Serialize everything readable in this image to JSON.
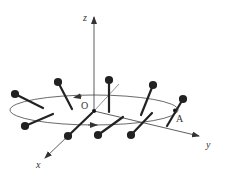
{
  "diagram": {
    "labels": {
      "z_axis": "z",
      "y_axis": "y",
      "x_axis": "x",
      "origin": "O",
      "point_a": "A"
    },
    "colors": {
      "line": "#333333",
      "rod": "#222222",
      "background": "#ffffff"
    },
    "rods": [
      {
        "x1": 15,
        "y1": 94,
        "x2": 43,
        "y2": 108
      },
      {
        "x1": 58,
        "y1": 82,
        "x2": 72,
        "y2": 109
      },
      {
        "x1": 109,
        "y1": 80,
        "x2": 109,
        "y2": 112
      },
      {
        "x1": 153,
        "y1": 85,
        "x2": 141,
        "y2": 115
      },
      {
        "x1": 183,
        "y1": 99,
        "x2": 167,
        "y2": 126
      },
      {
        "x1": 25,
        "y1": 126,
        "x2": 53,
        "y2": 114
      },
      {
        "x1": 68,
        "y1": 136,
        "x2": 92,
        "y2": 113
      },
      {
        "x1": 98,
        "y1": 135,
        "x2": 123,
        "y2": 117
      },
      {
        "x1": 131,
        "y1": 135,
        "x2": 152,
        "y2": 113
      }
    ]
  }
}
